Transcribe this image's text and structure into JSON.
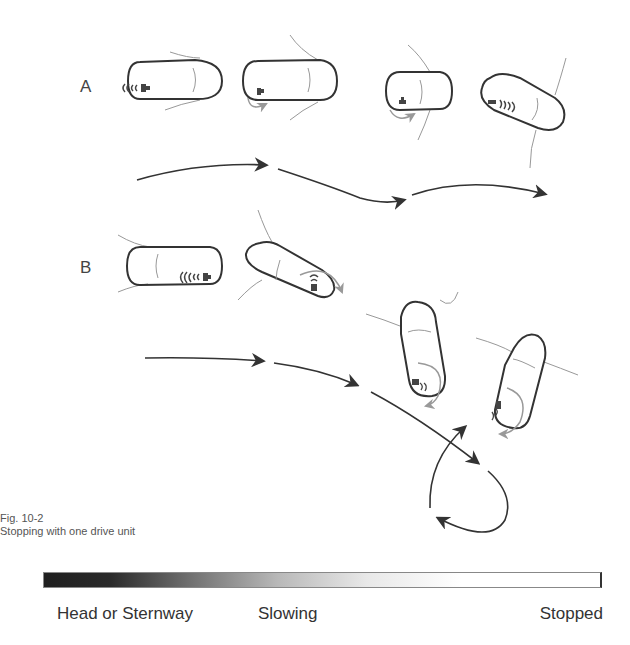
{
  "figure": {
    "number": "Fig. 10-2",
    "title": "Stopping with one drive unit"
  },
  "rows": [
    {
      "id": "A",
      "label": "A",
      "vessel_count": 4
    },
    {
      "id": "B",
      "label": "B",
      "vessel_count": 4
    }
  ],
  "legend": {
    "start_label": "Head or Sternway",
    "mid_label": "Slowing",
    "end_label": "Stopped",
    "gradient_from": "#1f1f1f",
    "gradient_to": "#ffffff"
  },
  "colors": {
    "hull_outline": "#333333",
    "wake_line": "#888888",
    "path_arrow": "#333333",
    "turn_arrow": "#999999"
  }
}
